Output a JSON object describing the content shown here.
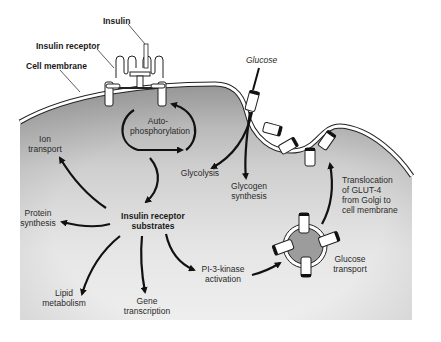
{
  "diagram": {
    "labels": {
      "insulin": "Insulin",
      "insulin_receptor": "Insulin receptor",
      "cell_membrane": "Cell membrane",
      "glucose": "Glucose",
      "autophosphorylation": [
        "Auto-",
        "phosphorylation"
      ],
      "ion_transport": [
        "Ion",
        "transport"
      ],
      "glycolysis": "Glycolysis",
      "glycogen_synthesis": [
        "Glycogen",
        "synthesis"
      ],
      "translocation": [
        "Translocation",
        "of GLUT-4",
        "from Golgi to",
        "cell membrane"
      ],
      "protein_synthesis": [
        "Protein",
        "synthesis"
      ],
      "irs": [
        "Insulin receptor",
        "substrates"
      ],
      "pi3k": [
        "PI-3-kinase",
        "activation"
      ],
      "glucose_transport": [
        "Glucose",
        "transport"
      ],
      "lipid_metabolism": [
        "Lipid",
        "metabolism"
      ],
      "gene_transcription": [
        "Gene",
        "transcription"
      ]
    },
    "colors": {
      "cytoplasm_dark": "#a8a8a8",
      "cytoplasm_light": "#ececec",
      "membrane": "#ffffff",
      "outline": "#222222",
      "vesicle_fill": "#9c9c9c"
    },
    "nodes": [
      {
        "id": "insulin",
        "label": "Insulin"
      },
      {
        "id": "receptor",
        "label": "Insulin receptor"
      },
      {
        "id": "autophos",
        "label": "Auto-phosphorylation"
      },
      {
        "id": "irs",
        "label": "Insulin receptor substrates"
      },
      {
        "id": "ion",
        "label": "Ion transport"
      },
      {
        "id": "protein",
        "label": "Protein synthesis"
      },
      {
        "id": "lipid",
        "label": "Lipid metabolism"
      },
      {
        "id": "gene",
        "label": "Gene transcription"
      },
      {
        "id": "pi3k",
        "label": "PI-3-kinase activation"
      },
      {
        "id": "gluttrans",
        "label": "Glucose transport"
      },
      {
        "id": "glut4",
        "label": "Translocation of GLUT-4 from Golgi to cell membrane"
      },
      {
        "id": "glucose",
        "label": "Glucose"
      },
      {
        "id": "glycolysis",
        "label": "Glycolysis"
      },
      {
        "id": "glycogen",
        "label": "Glycogen synthesis"
      }
    ],
    "edges": [
      {
        "from": "receptor",
        "to": "autophos"
      },
      {
        "from": "autophos",
        "to": "irs"
      },
      {
        "from": "irs",
        "to": "ion"
      },
      {
        "from": "irs",
        "to": "protein"
      },
      {
        "from": "irs",
        "to": "lipid"
      },
      {
        "from": "irs",
        "to": "gene"
      },
      {
        "from": "irs",
        "to": "pi3k"
      },
      {
        "from": "pi3k",
        "to": "gluttrans"
      },
      {
        "from": "gluttrans",
        "to": "glut4"
      },
      {
        "from": "glucose",
        "to": "glycolysis"
      },
      {
        "from": "glucose",
        "to": "glycogen"
      }
    ]
  }
}
